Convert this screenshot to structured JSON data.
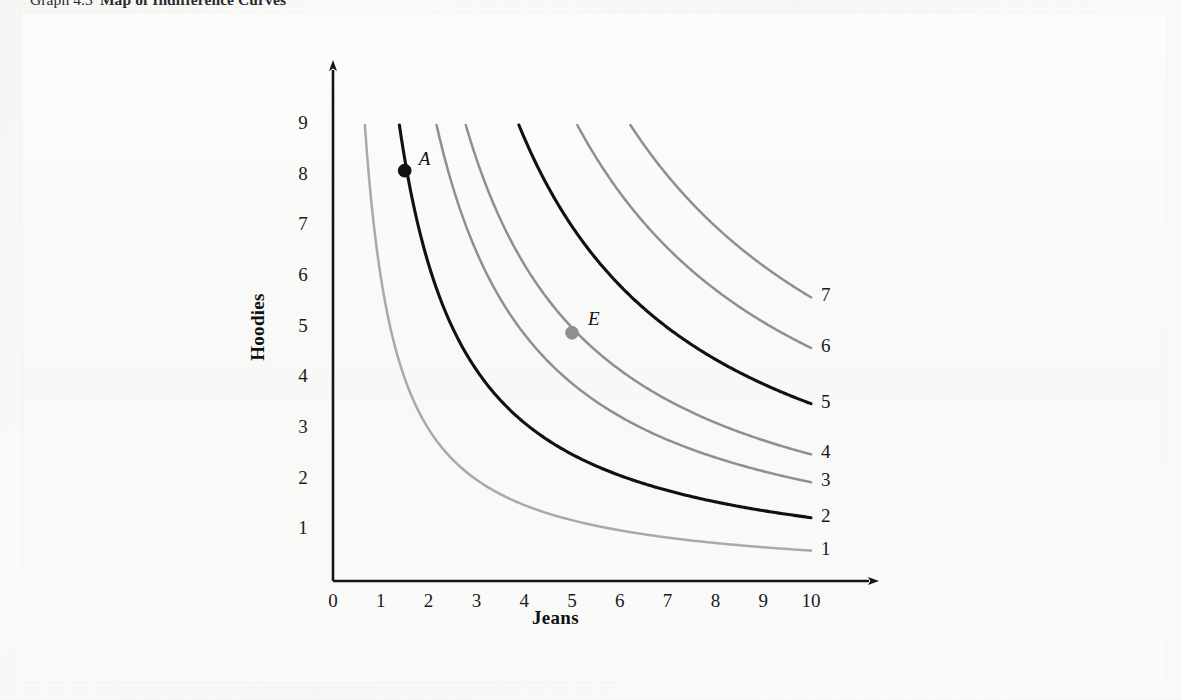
{
  "caption": {
    "number": "Graph 4.3",
    "title": "Map of Indifference Curves"
  },
  "chart_data": {
    "type": "line",
    "title": "Map of Indifference Curves",
    "xlabel": "Jeans",
    "ylabel": "Hoodies",
    "xlim": [
      0,
      10
    ],
    "ylim": [
      0,
      9.6
    ],
    "grid": false,
    "legend_position": "right-of-curve-ends",
    "x_ticks": [
      "0",
      "1",
      "2",
      "3",
      "4",
      "5",
      "6",
      "7",
      "8",
      "9",
      "10"
    ],
    "y_ticks": [
      "1",
      "2",
      "3",
      "4",
      "5",
      "6",
      "7",
      "8",
      "9"
    ],
    "note": "Seven convex indifference curves of the form Hoodies = k / Jeans, clipped at Hoodies = 9 and Jeans = 10. Higher-numbered curves lie farther from the origin (higher utility).",
    "series": [
      {
        "name": "1",
        "label": "1",
        "color": "#a9a9a9",
        "emphasis": "light",
        "k": 6.0,
        "x_at_y9": 0.67,
        "y_at_x10": 0.6,
        "points": [
          [
            0.67,
            9
          ],
          [
            0.8,
            7.5
          ],
          [
            1,
            6
          ],
          [
            1.3,
            4.6
          ],
          [
            1.7,
            3.5
          ],
          [
            2.2,
            2.7
          ],
          [
            3,
            2.0
          ],
          [
            4,
            1.5
          ],
          [
            5,
            1.2
          ],
          [
            6,
            1.0
          ],
          [
            7,
            0.86
          ],
          [
            8,
            0.75
          ],
          [
            9,
            0.67
          ],
          [
            10,
            0.6
          ]
        ]
      },
      {
        "name": "2",
        "label": "2",
        "color": "#111111",
        "emphasis": "black",
        "k": 12.5,
        "x_at_y9": 1.39,
        "y_at_x10": 1.25,
        "points": [
          [
            1.39,
            9
          ],
          [
            1.5,
            8.1
          ],
          [
            1.8,
            6.9
          ],
          [
            2.2,
            5.7
          ],
          [
            2.8,
            4.5
          ],
          [
            3.5,
            3.6
          ],
          [
            4.5,
            2.8
          ],
          [
            5.5,
            2.3
          ],
          [
            6.5,
            1.9
          ],
          [
            7.5,
            1.67
          ],
          [
            8.5,
            1.47
          ],
          [
            10,
            1.25
          ]
        ]
      },
      {
        "name": "3",
        "label": "3",
        "color": "#8f8f8f",
        "emphasis": "gray",
        "k": 19.5,
        "x_at_y9": 2.17,
        "y_at_x10": 1.95,
        "points": [
          [
            2.17,
            9
          ],
          [
            2.5,
            7.8
          ],
          [
            3,
            6.5
          ],
          [
            3.7,
            5.3
          ],
          [
            4.5,
            4.3
          ],
          [
            5.5,
            3.55
          ],
          [
            6.5,
            3.0
          ],
          [
            7.5,
            2.6
          ],
          [
            8.5,
            2.3
          ],
          [
            10,
            1.95
          ]
        ]
      },
      {
        "name": "4",
        "label": "4",
        "color": "#8f8f8f",
        "emphasis": "gray",
        "k": 25.0,
        "x_at_y9": 2.78,
        "y_at_x10": 2.5,
        "points": [
          [
            2.78,
            9
          ],
          [
            3.2,
            7.8
          ],
          [
            3.8,
            6.6
          ],
          [
            4.5,
            5.55
          ],
          [
            5.0,
            4.9
          ],
          [
            6,
            4.15
          ],
          [
            7,
            3.55
          ],
          [
            8,
            3.1
          ],
          [
            9,
            2.78
          ],
          [
            10,
            2.5
          ]
        ]
      },
      {
        "name": "5",
        "label": "5",
        "color": "#111111",
        "emphasis": "black",
        "k": 35.0,
        "x_at_y9": 3.89,
        "y_at_x10": 3.5,
        "points": [
          [
            3.89,
            9
          ],
          [
            4.4,
            7.95
          ],
          [
            5,
            7.0
          ],
          [
            5.8,
            6.05
          ],
          [
            6.6,
            5.3
          ],
          [
            7.5,
            4.65
          ],
          [
            8.5,
            4.1
          ],
          [
            9.2,
            3.8
          ],
          [
            10,
            3.5
          ]
        ]
      },
      {
        "name": "6",
        "label": "6",
        "color": "#8f8f8f",
        "emphasis": "gray",
        "k": 46.0,
        "x_at_y9": 5.11,
        "y_at_x10": 4.6,
        "points": [
          [
            5.11,
            9
          ],
          [
            5.6,
            8.2
          ],
          [
            6.3,
            7.3
          ],
          [
            7,
            6.55
          ],
          [
            7.8,
            5.9
          ],
          [
            8.6,
            5.35
          ],
          [
            9.3,
            4.95
          ],
          [
            10,
            4.6
          ]
        ]
      },
      {
        "name": "7",
        "label": "7",
        "color": "#8f8f8f",
        "emphasis": "gray",
        "k": 56.0,
        "x_at_y9": 6.22,
        "y_at_x10": 5.6,
        "points": [
          [
            6.22,
            9
          ],
          [
            6.8,
            8.25
          ],
          [
            7.4,
            7.55
          ],
          [
            8,
            7.0
          ],
          [
            8.7,
            6.45
          ],
          [
            9.3,
            6.0
          ],
          [
            10,
            5.6
          ]
        ]
      }
    ],
    "annotations": [
      {
        "label": "A",
        "x": 1.5,
        "y": 8.1,
        "on_curve": "2",
        "marker": "filled-circle",
        "color": "#111111",
        "label_offset": [
          14,
          -16
        ]
      },
      {
        "label": "E",
        "x": 5.0,
        "y": 4.9,
        "on_curve": "4",
        "marker": "filled-circle",
        "color": "#8f8f8f",
        "label_offset": [
          16,
          -18
        ]
      }
    ]
  },
  "axes": {
    "x_title": "Jeans",
    "y_title": "Hoodies"
  },
  "colors": {
    "black_curve": "#111111",
    "gray_curve": "#8f8f8f",
    "light_gray_curve": "#a9a9a9",
    "axis": "#151515",
    "background": "#fbfbfa"
  }
}
